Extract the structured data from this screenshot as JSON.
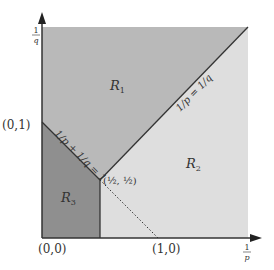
{
  "diagram": {
    "axes": {
      "x_label_num": "1",
      "x_label_den": "p",
      "y_label_num": "1",
      "y_label_den": "q"
    },
    "regions": {
      "r1": {
        "label": "R",
        "sub": "1",
        "color": "#b9b9b9"
      },
      "r2": {
        "label": "R",
        "sub": "2",
        "color": "#dedede"
      },
      "r3": {
        "label": "R",
        "sub": "3",
        "color": "#8f8f8f"
      }
    },
    "points": {
      "origin": "(0,0)",
      "x_one": "(1,0)",
      "y_one": "(0,1)",
      "half": "(½, ½)"
    },
    "lines": {
      "anti_diagonal": "1/p + 1/q = 1",
      "diagonal": "1/p = 1/q"
    }
  }
}
